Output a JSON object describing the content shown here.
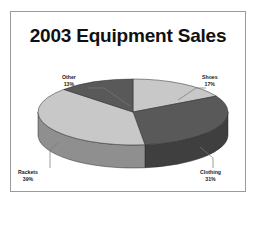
{
  "chart_data": {
    "type": "pie",
    "title": "2003 Equipment Sales",
    "xlabel": "",
    "ylabel": "",
    "categories": [
      "Shoes",
      "Clothing",
      "Rackets",
      "Other"
    ],
    "values": [
      17,
      31,
      39,
      13
    ],
    "value_unit": "%",
    "labels": [
      "Shoes",
      "Clothing",
      "Rackets",
      "Other"
    ],
    "data_labels": [
      "17%",
      "31%",
      "39%",
      "13%"
    ],
    "legend": "none",
    "grid": false,
    "three_d": true,
    "slice_colors": [
      "#c8c8c8",
      "#595959",
      "#c8c8c8",
      "#595959"
    ],
    "slice_side_colors": [
      "#8f8f8f",
      "#3f3f3f",
      "#8f8f8f",
      "#3f3f3f"
    ],
    "slices": [
      {
        "name": "Shoes",
        "percent": 17,
        "label": "Shoes",
        "pct_label": "17%",
        "color": "#c8c8c8"
      },
      {
        "name": "Clothing",
        "percent": 31,
        "label": "Clothing",
        "pct_label": "31%",
        "color": "#595959"
      },
      {
        "name": "Rackets",
        "percent": 39,
        "label": "Rackets",
        "pct_label": "39%",
        "color": "#c8c8c8"
      },
      {
        "name": "Other",
        "percent": 13,
        "label": "Other",
        "pct_label": "13%",
        "color": "#595959"
      }
    ]
  },
  "frame": {
    "border_color": "#9a9a9a",
    "background": "#ffffff"
  },
  "title": {
    "text": "2003 Equipment Sales"
  },
  "labels": {
    "other": {
      "name": "Other",
      "pct": "13%"
    },
    "shoes": {
      "name": "Shoes",
      "pct": "17%"
    },
    "rackets": {
      "name": "Rackets",
      "pct": "39%"
    },
    "clothing": {
      "name": "Clothing",
      "pct": "31%"
    }
  }
}
